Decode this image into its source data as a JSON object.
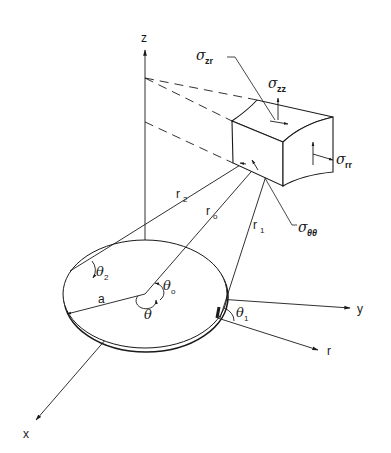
{
  "figure": {
    "axes": {
      "z": "z",
      "y": "y",
      "x": "x",
      "r": "r"
    },
    "distances": {
      "r2": {
        "base": "r",
        "sub": "2"
      },
      "r0": {
        "base": "r",
        "sub": "o"
      },
      "r1": {
        "base": "r",
        "sub": "1"
      },
      "radius": "a"
    },
    "angles": {
      "theta": "θ",
      "theta0": {
        "base": "θ",
        "sub": "o"
      },
      "theta1": {
        "base": "θ",
        "sub": "1"
      },
      "theta2": {
        "base": "θ",
        "sub": "2"
      }
    },
    "stresses": {
      "sigma_zr": {
        "base": "σ",
        "sub": "zr"
      },
      "sigma_zz": {
        "base": "σ",
        "sub": "zz"
      },
      "sigma_rr": {
        "base": "σ",
        "sub": "rr"
      },
      "sigma_tt": {
        "base": "σ",
        "sub": "θθ"
      }
    },
    "colors": {
      "ink": "#1a1a1a",
      "background": "#ffffff"
    }
  }
}
